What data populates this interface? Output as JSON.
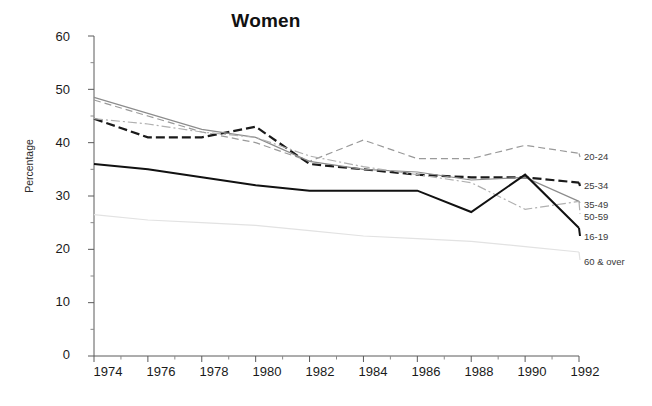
{
  "chart_data": {
    "type": "line",
    "title": "Women",
    "xlabel": "",
    "ylabel": "Percentage",
    "x": [
      1974,
      1976,
      1978,
      1980,
      1982,
      1984,
      1986,
      1988,
      1990,
      1992
    ],
    "xlim": [
      1974,
      1992
    ],
    "ylim": [
      0,
      60
    ],
    "yticks": [
      0,
      10,
      20,
      30,
      40,
      50,
      60
    ],
    "xticks": [
      1974,
      1976,
      1978,
      1980,
      1982,
      1984,
      1986,
      1988,
      1990,
      1992
    ],
    "minor_xticks": [
      1975,
      1977,
      1979,
      1981,
      1983,
      1985,
      1987,
      1989,
      1991
    ],
    "minor_yticks": [
      5,
      15,
      25,
      35,
      45,
      55
    ],
    "grid": false,
    "legend_position": "right-outside",
    "series": [
      {
        "name": "20-24",
        "values": [
          48.0,
          45.0,
          42.0,
          40.0,
          36.5,
          40.5,
          37.0,
          37.0,
          39.5,
          38.0
        ],
        "color": "#9a9a9a",
        "style": "dashed"
      },
      {
        "name": "25-34",
        "values": [
          44.5,
          41.0,
          41.0,
          43.0,
          36.0,
          35.0,
          34.0,
          33.5,
          33.5,
          32.5
        ],
        "color": "#1a1a1a",
        "style": "dashed-thick"
      },
      {
        "name": "35-49",
        "values": [
          48.5,
          45.5,
          42.5,
          41.0,
          36.5,
          35.0,
          34.5,
          33.0,
          33.5,
          29.0
        ],
        "color": "#8c8c8c",
        "style": "solid"
      },
      {
        "name": "50-59",
        "values": [
          44.5,
          43.5,
          42.0,
          41.0,
          37.5,
          35.5,
          34.0,
          32.5,
          27.5,
          29.0
        ],
        "color": "#b0b0b0",
        "style": "dash-dot"
      },
      {
        "name": "16-19",
        "values": [
          36.0,
          35.0,
          33.5,
          32.0,
          31.0,
          31.0,
          31.0,
          27.0,
          34.0,
          24.0
        ],
        "color": "#111111",
        "style": "solid-thick"
      },
      {
        "name": "60 & over",
        "values": [
          26.5,
          25.5,
          25.0,
          24.5,
          23.5,
          22.5,
          22.0,
          21.5,
          20.5,
          19.5
        ],
        "color": "#e2e2e2",
        "style": "solid"
      }
    ]
  },
  "axis": {
    "ytick_labels": [
      "60",
      "50",
      "40",
      "30",
      "20",
      "10",
      "0"
    ],
    "xtick_labels": [
      "1974",
      "1976",
      "1978",
      "1980",
      "1982",
      "1984",
      "1986",
      "1988",
      "1990",
      "1992"
    ],
    "ylabel": "Percentage"
  },
  "title": {
    "text": "Women"
  },
  "legend": {
    "items": [
      {
        "label": "20-24"
      },
      {
        "label": "25-34"
      },
      {
        "label": "35-49"
      },
      {
        "label": "50-59"
      },
      {
        "label": "16-19"
      },
      {
        "label": "60 & over"
      }
    ]
  }
}
